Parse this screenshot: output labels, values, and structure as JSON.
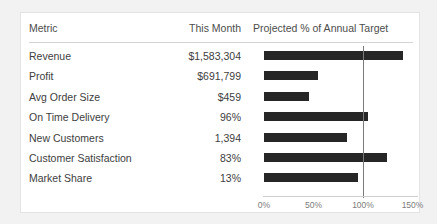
{
  "card": {
    "title_present": false
  },
  "table": {
    "headers": {
      "metric": "Metric",
      "value": "This Month",
      "chart": "Projected % of  Annual Target"
    },
    "rows": [
      {
        "metric": "Revenue",
        "value": "$1,583,304"
      },
      {
        "metric": "Profit",
        "value": "$691,799"
      },
      {
        "metric": "Avg Order Size",
        "value": "$459"
      },
      {
        "metric": "On Time Delivery",
        "value": "96%"
      },
      {
        "metric": "New Customers",
        "value": "1,394"
      },
      {
        "metric": "Customer Satisfaction",
        "value": "83%"
      },
      {
        "metric": "Market Share",
        "value": "13%"
      }
    ]
  },
  "axis": {
    "ticks": [
      "0%",
      "50%",
      "100%",
      "150%"
    ],
    "tick_values": [
      0,
      50,
      100,
      150
    ]
  },
  "colors": {
    "bar": "#262626",
    "target_line": "#7a7a7a",
    "page_background": "#f2f2f2",
    "card_background": "#ffffff",
    "rule": "#d4d4d4",
    "header_text": "#4d4d4d",
    "body_text": "#404040",
    "axis_text": "#7d7d7d"
  },
  "chart_data": {
    "type": "bar",
    "orientation": "horizontal",
    "title": "Projected % of  Annual Target",
    "xlabel": "",
    "ylabel": "",
    "xlim": [
      0,
      150
    ],
    "grid": false,
    "legend": false,
    "reference_line": 100,
    "categories": [
      "Revenue",
      "Profit",
      "Avg Order Size",
      "On Time Delivery",
      "New Customers",
      "Customer Satisfaction",
      "Market Share"
    ],
    "values": [
      140,
      55,
      45,
      105,
      84,
      124,
      95
    ],
    "tick_labels": [
      "0%",
      "50%",
      "100%",
      "150%"
    ],
    "tick_values": [
      0,
      50,
      100,
      150
    ],
    "value_column_label": "This Month",
    "value_column": [
      "$1,583,304",
      "$691,799",
      "$459",
      "96%",
      "1,394",
      "83%",
      "13%"
    ]
  }
}
